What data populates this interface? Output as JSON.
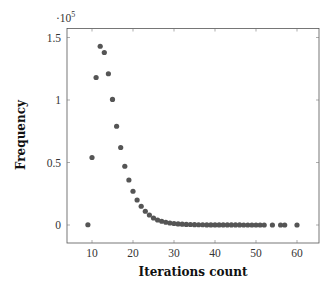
{
  "chart_data": {
    "type": "scatter",
    "title": "",
    "xlabel": "Iterations count",
    "ylabel": "Frequency",
    "y_scale_label": "·10^5",
    "xlim": [
      3.5,
      64.5
    ],
    "ylim": [
      -0.08,
      1.58
    ],
    "xticks": [
      10,
      20,
      30,
      40,
      50,
      60
    ],
    "yticks": [
      0,
      0.5,
      1,
      1.5
    ],
    "ytick_labels": [
      "0",
      "0.5",
      "1",
      "1.5"
    ],
    "grid": false,
    "marker_color": "#555555",
    "x": [
      9,
      10,
      11,
      12,
      13,
      14,
      15,
      16,
      17,
      18,
      19,
      20,
      21,
      22,
      23,
      24,
      25,
      26,
      27,
      28,
      29,
      30,
      31,
      32,
      33,
      34,
      35,
      36,
      37,
      38,
      39,
      40,
      41,
      42,
      43,
      44,
      45,
      46,
      47,
      48,
      49,
      50,
      51,
      52,
      54,
      56,
      57,
      60
    ],
    "y": [
      0.002,
      0.54,
      1.18,
      1.43,
      1.38,
      1.21,
      1.005,
      0.79,
      0.62,
      0.47,
      0.36,
      0.27,
      0.2,
      0.15,
      0.11,
      0.08,
      0.056,
      0.04,
      0.03,
      0.022,
      0.016,
      0.012,
      0.009,
      0.007,
      0.005,
      0.004,
      0.003,
      0.002,
      0.002,
      0.001,
      0.001,
      0.001,
      0.001,
      0.0005,
      0.0005,
      0.0005,
      0.0003,
      0.0003,
      0.0002,
      0.0002,
      0.0001,
      0.0001,
      0.0001,
      0.0001,
      0.0001,
      0.0001,
      0.0001,
      0.0001
    ]
  }
}
